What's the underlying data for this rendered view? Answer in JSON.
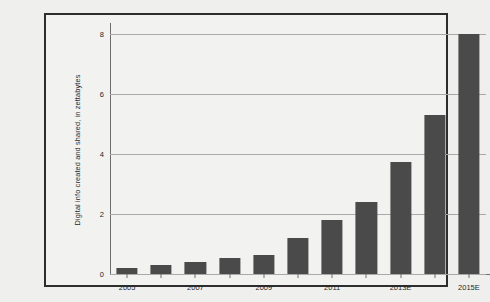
{
  "chart_data": {
    "type": "bar",
    "title": "",
    "xlabel": "",
    "ylabel": "Digital info created and shared, in zettabytes",
    "categories": [
      "2005",
      "2006",
      "2007",
      "2008",
      "2009",
      "2010",
      "2011",
      "2012",
      "2013E",
      "2014E",
      "2015E"
    ],
    "values": [
      0.2,
      0.3,
      0.4,
      0.55,
      0.65,
      1.2,
      1.8,
      2.4,
      3.75,
      5.3,
      8.0
    ],
    "x_tick_labels": [
      "2005",
      "",
      "2007",
      "",
      "2009",
      "",
      "2011",
      "",
      "2013E",
      "",
      "2015E"
    ],
    "ylim": [
      0,
      8
    ],
    "y_ticks": [
      0,
      2,
      4,
      6,
      8
    ],
    "y_tick_labels": [
      "0",
      "2",
      "4",
      "6",
      "8"
    ],
    "grid": true,
    "legend": false,
    "bar_color": "#4a4a4a",
    "gridline_color": "#a9a9a9",
    "axis_color": "#6d6d6d",
    "frame_color": "#2e2e2e",
    "background_color": "#efefed"
  }
}
